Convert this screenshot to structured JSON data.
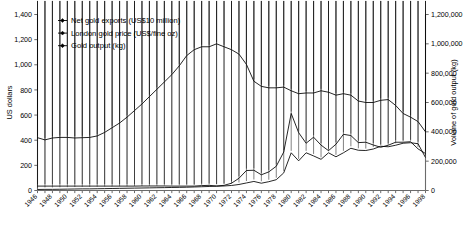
{
  "chart_data": {
    "type": "line",
    "title": "",
    "xlabel": "",
    "grid": false,
    "legend_position": "top-left",
    "x": [
      1946,
      1947,
      1948,
      1949,
      1950,
      1951,
      1952,
      1953,
      1954,
      1955,
      1956,
      1957,
      1958,
      1959,
      1960,
      1961,
      1962,
      1963,
      1964,
      1965,
      1966,
      1967,
      1968,
      1969,
      1970,
      1971,
      1972,
      1973,
      1974,
      1975,
      1976,
      1977,
      1978,
      1979,
      1980,
      1981,
      1982,
      1983,
      1984,
      1985,
      1986,
      1987,
      1988,
      1989,
      1990,
      1991,
      1992,
      1993,
      1994,
      1995,
      1996,
      1997,
      1998
    ],
    "xtick_labels": [
      "1946",
      "1948",
      "1950",
      "1952",
      "1954",
      "1956",
      "1958",
      "1960",
      "1962",
      "1964",
      "1966",
      "1968",
      "1970",
      "1972",
      "1974",
      "1976",
      "1978",
      "1980",
      "1982",
      "1984",
      "1986",
      "1988",
      "1990",
      "1992",
      "1994",
      "1996",
      "1998"
    ],
    "axes": [
      {
        "id": "left",
        "label": "US dollars",
        "lim": [
          0,
          1400
        ],
        "ticks": [
          0,
          200,
          400,
          600,
          800,
          1000,
          1200,
          1400
        ],
        "tick_labels": [
          "0",
          "200",
          "400",
          "600",
          "800",
          "1,000",
          "1,200",
          "1,400"
        ]
      },
      {
        "id": "right",
        "label": "Volume of gold output (kg)",
        "lim": [
          0,
          1200000
        ],
        "ticks": [
          0,
          200000,
          400000,
          600000,
          800000,
          1000000,
          1200000
        ],
        "tick_labels": [
          "0",
          "200,000",
          "400,000",
          "600,000",
          "800,000",
          "1,000,000",
          "1,200,000"
        ]
      }
    ],
    "series": [
      {
        "name": "Net gold exports (US$10 million)",
        "axis": "left",
        "marker": "diamond",
        "values": [
          8,
          9,
          9,
          10,
          11,
          12,
          13,
          13,
          14,
          15,
          16,
          17,
          18,
          19,
          20,
          21,
          22,
          23,
          24,
          25,
          26,
          28,
          30,
          32,
          34,
          36,
          40,
          48,
          60,
          72,
          58,
          70,
          86,
          140,
          300,
          236,
          300,
          275,
          248,
          300,
          268,
          300,
          336,
          320,
          318,
          330,
          352,
          348,
          360,
          376,
          380,
          372,
          262
        ]
      },
      {
        "name": "London gold price (US$/fine oz)",
        "axis": "left",
        "marker": "diamond",
        "values": [
          35,
          35,
          35,
          35,
          35,
          35,
          35,
          35,
          35,
          35,
          35,
          35,
          35,
          35,
          36,
          36,
          36,
          36,
          35,
          35,
          35,
          35,
          39,
          41,
          36,
          41,
          58,
          97,
          159,
          161,
          125,
          148,
          193,
          306,
          613,
          460,
          376,
          424,
          361,
          317,
          368,
          447,
          437,
          381,
          384,
          362,
          344,
          360,
          384,
          384,
          388,
          331,
          294
        ]
      },
      {
        "name": "Gold output (kg)",
        "axis": "right",
        "marker": "diamond",
        "values": [
          360000,
          345000,
          358000,
          362000,
          362000,
          358000,
          360000,
          362000,
          372000,
          396000,
          428000,
          460000,
          500000,
          545000,
          590000,
          640000,
          690000,
          740000,
          790000,
          850000,
          920000,
          960000,
          980000,
          980000,
          1000000,
          980000,
          960000,
          930000,
          860000,
          745000,
          710000,
          700000,
          700000,
          705000,
          680000,
          660000,
          665000,
          665000,
          680000,
          670000,
          650000,
          660000,
          650000,
          610000,
          600000,
          600000,
          615000,
          620000,
          580000,
          525000,
          500000,
          470000,
          400000
        ]
      }
    ]
  }
}
